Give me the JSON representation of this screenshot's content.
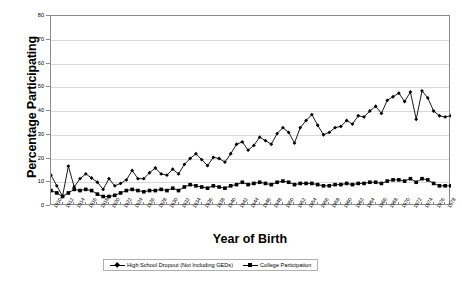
{
  "chart_data": {
    "type": "line",
    "title": "",
    "xlabel": "Year of Birth",
    "ylabel": "Percentage Participating",
    "ylim": [
      0,
      80
    ],
    "ytick_step": 10,
    "yticks": [
      0,
      10,
      20,
      30,
      40,
      50,
      60,
      70,
      80
    ],
    "grid": true,
    "legend_position": "bottom",
    "x_tick_step": 2,
    "x": [
      1910,
      1911,
      1912,
      1913,
      1914,
      1915,
      1916,
      1917,
      1918,
      1919,
      1920,
      1921,
      1922,
      1923,
      1924,
      1925,
      1926,
      1927,
      1928,
      1929,
      1930,
      1931,
      1932,
      1933,
      1934,
      1935,
      1936,
      1937,
      1938,
      1939,
      1940,
      1941,
      1942,
      1943,
      1944,
      1945,
      1946,
      1947,
      1948,
      1949,
      1950,
      1951,
      1952,
      1953,
      1954,
      1955,
      1956,
      1957,
      1958,
      1959,
      1960,
      1961,
      1962,
      1963,
      1964,
      1965,
      1966,
      1967,
      1968,
      1969,
      1970,
      1971,
      1972,
      1973,
      1974,
      1975,
      1976,
      1977,
      1978,
      1979
    ],
    "xticklabels": [
      "1910",
      "1912",
      "1914",
      "1916",
      "1918",
      "1920",
      "1922",
      "1924",
      "1926",
      "1928",
      "1930",
      "1932",
      "1934",
      "1936",
      "1938",
      "1940",
      "1942",
      "1944",
      "1946",
      "1948",
      "1950",
      "1952",
      "1954",
      "1956",
      "1958",
      "1960",
      "1962",
      "1964",
      "1966",
      "1968",
      "1970",
      "1972",
      "1974",
      "1976",
      "1978"
    ],
    "series": [
      {
        "name": "High School Dropout (Not Including GEDs)",
        "marker": "diamond",
        "color": "#000000",
        "values": [
          13.0,
          8.5,
          4.2,
          16.8,
          8.0,
          11.5,
          13.5,
          11.8,
          10.0,
          7.0,
          11.5,
          8.5,
          9.5,
          11.0,
          15.0,
          11.5,
          11.5,
          14.0,
          16.0,
          13.5,
          13.0,
          15.5,
          13.5,
          17.5,
          20.0,
          22.0,
          19.5,
          17.0,
          20.5,
          20.0,
          18.5,
          22.0,
          26.0,
          27.0,
          23.5,
          25.5,
          29.0,
          27.5,
          26.0,
          30.5,
          33.0,
          31.0,
          26.5,
          33.0,
          36.0,
          38.5,
          34.0,
          30.0,
          31.0,
          33.0,
          33.5,
          36.0,
          34.5,
          38.0,
          37.5,
          40.0,
          42.0,
          39.0,
          44.5,
          46.0,
          47.5,
          44.0,
          48.0,
          36.5,
          48.5,
          45.5,
          40.0,
          38.0,
          37.5,
          38.0
        ]
      },
      {
        "name": "College Participation",
        "marker": "square",
        "color": "#000000",
        "values": [
          6.5,
          5.5,
          4.0,
          5.5,
          7.0,
          6.5,
          7.0,
          6.5,
          5.0,
          4.0,
          4.0,
          4.5,
          5.5,
          6.5,
          7.0,
          6.5,
          6.0,
          6.5,
          6.5,
          7.0,
          6.5,
          7.5,
          6.5,
          8.0,
          9.0,
          8.5,
          8.0,
          7.5,
          8.5,
          8.0,
          7.5,
          8.5,
          9.0,
          10.0,
          9.0,
          9.5,
          10.0,
          9.5,
          9.0,
          10.0,
          10.5,
          10.0,
          9.0,
          9.5,
          9.5,
          9.5,
          9.0,
          8.5,
          8.5,
          9.0,
          9.0,
          9.5,
          9.0,
          9.5,
          9.5,
          10.0,
          10.0,
          9.5,
          10.5,
          11.0,
          11.0,
          10.5,
          11.5,
          10.0,
          11.5,
          11.0,
          9.5,
          8.5,
          8.5,
          8.5
        ]
      }
    ]
  },
  "legend": {
    "entries": [
      {
        "label": "High School Dropout (Not Including GEDs)"
      },
      {
        "label": "College Participation"
      }
    ]
  }
}
